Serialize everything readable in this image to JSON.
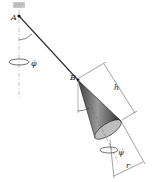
{
  "figure": {
    "labels": {
      "point_a": "A",
      "point_b": "B",
      "angle_beta": "β",
      "angle_theta": "θ",
      "precession_rate": "φ̇",
      "spin_rate": "ψ̇",
      "height": "h",
      "radius": "r"
    }
  }
}
